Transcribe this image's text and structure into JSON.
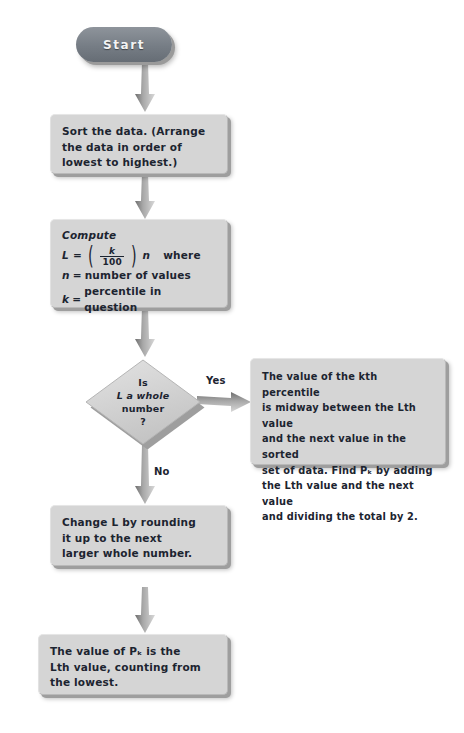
{
  "diagram": {
    "colors": {
      "node_fill": "#d5d5d5",
      "node_shadow": "#9e9e9e",
      "start_fill": "#767d85",
      "text": "#1c2430",
      "arrow": "#9a9a9a",
      "background": "#ffffff"
    },
    "nodes": {
      "start": {
        "label": "Start",
        "shape": "terminator"
      },
      "sort": {
        "shape": "process",
        "lines": [
          "Sort the data. (Arrange",
          "the data in order of",
          "lowest to highest.)"
        ]
      },
      "compute": {
        "shape": "process",
        "heading": "Compute",
        "formula": {
          "lhs": "L",
          "equals": "=",
          "numerator": "k",
          "denominator": "100",
          "multiplier": "n",
          "where": "where"
        },
        "definitions": [
          {
            "symbol": "n",
            "equals": "=",
            "text": "number of values"
          },
          {
            "symbol": "k",
            "equals": "=",
            "text": "percentile in question"
          }
        ]
      },
      "decision": {
        "shape": "diamond",
        "lines": [
          "Is",
          "L a whole",
          "number",
          "?"
        ]
      },
      "yes_result": {
        "shape": "process",
        "lines": [
          "The value of the kth percentile",
          "is midway between the Lth value",
          "and the next value in the sorted",
          "set of data. Find Pₖ by adding",
          "the Lth value and the next value",
          "and dividing the total by 2."
        ]
      },
      "round_up": {
        "shape": "process",
        "lines": [
          "Change L by rounding",
          "it up to the next",
          "larger whole number."
        ]
      },
      "final_result": {
        "shape": "process",
        "lines": [
          "The value of Pₖ is the",
          "Lth value, counting from",
          "the lowest."
        ]
      }
    },
    "edges": {
      "yes_label": "Yes",
      "no_label": "No"
    }
  }
}
